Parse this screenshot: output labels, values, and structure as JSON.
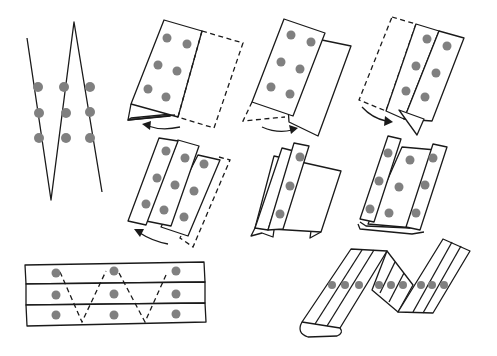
{
  "diagram": {
    "title": "Map folding steps (zigzag / accordion fold)",
    "colors": {
      "line": "#1a1a1a",
      "dot": "#808080",
      "background": "#ffffff"
    },
    "panels": [
      {
        "id": "zigzag-lines",
        "description": "Zigzag crease lines crossing a 3x3 grid of dots"
      },
      {
        "id": "step-1",
        "description": "Sheet folded along dashed line, right panel flips under; arrow left"
      },
      {
        "id": "step-2",
        "description": "Panel folded, dashed flap folds under; arrow right"
      },
      {
        "id": "step-3",
        "description": "Dashed left panel folds behind; arrow right"
      },
      {
        "id": "step-4",
        "description": "Three-panel stack with dashed edge folding; arrow left"
      },
      {
        "id": "step-5",
        "description": "Narrow strip over wide panel"
      },
      {
        "id": "step-6",
        "description": "Two strips folded at edges over central panel"
      },
      {
        "id": "strip-grid",
        "description": "Three horizontal strips with 3x3 dots and dashed zigzag"
      },
      {
        "id": "accordion",
        "description": "Accordion-folded strip with a row of nine dots"
      }
    ],
    "dot_counts": {
      "zigzag-lines": 9,
      "step-1": 6,
      "step-2": 6,
      "step-3": 6,
      "step-4": 9,
      "step-5": 3,
      "step-6": 9,
      "strip-grid": 9,
      "accordion": 9
    },
    "icons": [
      "curved-arrow-left-icon",
      "curved-arrow-right-icon"
    ]
  }
}
